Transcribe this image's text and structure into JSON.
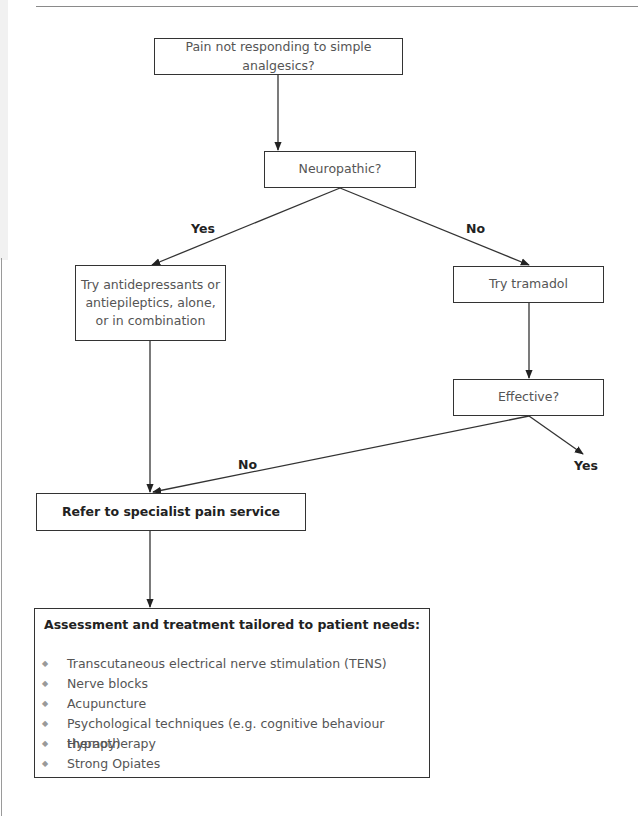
{
  "flowchart": {
    "start": {
      "label": "Pain not responding to simple analgesics?"
    },
    "decision_neuropathic": {
      "label": "Neuropathic?"
    },
    "branch_yes_label": "Yes",
    "branch_no_label": "No",
    "yes_action": {
      "label": "Try antidepressants or antiepileptics, alone, or in combination"
    },
    "no_action": {
      "label": "Try tramadol"
    },
    "decision_effective": {
      "label": "Effective?"
    },
    "effective_no_label": "No",
    "effective_yes_label": "Yes",
    "refer": {
      "label": "Refer to specialist pain service"
    },
    "assessment": {
      "title": "Assessment and treatment tailored to patient needs:",
      "bullet_glyph": "◆",
      "items": [
        "Transcutaneous electrical nerve stimulation (TENS)",
        "Nerve blocks",
        "Acupuncture",
        "Psychological techniques (e.g. cognitive behaviour therapy)",
        "Hypnotherapy",
        "Strong Opiates"
      ]
    }
  },
  "colors": {
    "line": "#333333",
    "text": "#555555",
    "bold_text": "#222222",
    "bullet": "#9a9a9a"
  }
}
